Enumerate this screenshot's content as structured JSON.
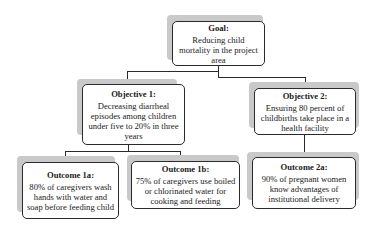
{
  "diagram": {
    "goal": {
      "title": "Goal:",
      "text": "Reducing child mortality in the project area"
    },
    "objectives": [
      {
        "title": "Objective 1:",
        "text": "Decreasing diarrheal episodes among children under five to 20% in three years"
      },
      {
        "title": "Objective 2:",
        "text": "Ensuring 80 percent of childbirths take place in a health facility"
      }
    ],
    "outcomes": [
      {
        "title": "Outcome 1a:",
        "text": "80% of caregivers wash hands with water and soap before feeding child"
      },
      {
        "title": "Outcome 1b:",
        "text": "75% of caregivers use boiled or chlorinated water for cooking and feeding"
      },
      {
        "title": "Outcome 2a:",
        "text": "90% of pregnant women know advantages of institutional delivery"
      }
    ],
    "colors": {
      "border": "#2a2a2a",
      "shadow": "#c9c9c9",
      "background": "#ffffff"
    }
  }
}
